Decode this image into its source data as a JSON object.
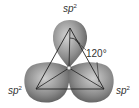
{
  "diagram": {
    "labels": {
      "top": {
        "base": "sp",
        "superscript": "2"
      },
      "left": {
        "base": "sp",
        "superscript": "2"
      },
      "right": {
        "base": "sp",
        "superscript": "2"
      }
    },
    "angle_label": "120°",
    "colors": {
      "lobe_light": "#c8c8c8",
      "lobe_dark": "#5a5a5a",
      "line": "#222222",
      "text": "#333333"
    }
  }
}
